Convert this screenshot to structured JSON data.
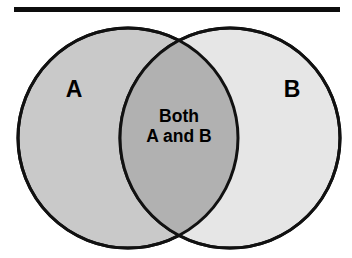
{
  "figure": {
    "type": "venn-diagram",
    "title": "",
    "background_color": "#ffffff",
    "width": 352,
    "height": 258
  },
  "rule": {
    "name": "top-horizontal-rule",
    "color": "#0d0d0d",
    "x": 14,
    "y": 7,
    "width": 326,
    "height": 5
  },
  "sets": {
    "left": {
      "label": "A",
      "fill_color": "#c9c9c9",
      "stroke_color": "#111111",
      "cx": 128,
      "cy": 138,
      "r": 110,
      "label_x": 74,
      "label_y": 91
    },
    "right": {
      "label": "B",
      "fill_color": "#e6e6e6",
      "stroke_color": "#111111",
      "cx": 230,
      "cy": 138,
      "r": 110,
      "label_x": 292,
      "label_y": 91
    }
  },
  "intersection": {
    "name": "both-a-and-b-region",
    "fill_color": "#b1b1b1",
    "stroke_color": "#111111",
    "label_line_1": "Both",
    "label_line_2": "A and B",
    "label_x": 179,
    "label_line_1_y": 117,
    "label_line_2_y": 137
  },
  "colors": {
    "stroke": "#111111",
    "left_fill": "#c9c9c9",
    "right_fill": "#e6e6e6",
    "overlap_fill": "#b1b1b1",
    "text": "#000000",
    "rule": "#0d0d0d",
    "background": "#ffffff"
  }
}
